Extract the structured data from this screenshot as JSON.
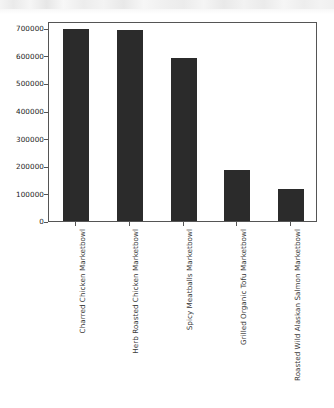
{
  "chart_data": {
    "type": "bar",
    "title": "",
    "subtitle": "",
    "xlabel": "",
    "ylabel": "",
    "categories": [
      "Charred Chicken Marketbowl",
      "Herb Roasted Chicken Marketbowl",
      "Spicy Meatballs Marketbowl",
      "Grilled Organic Tofu Marketbowl",
      "Roasted Wild Alaskan Salmon Marketbowl"
    ],
    "values": [
      697000,
      693000,
      590000,
      185000,
      117000
    ],
    "ylim": [
      0,
      725000
    ],
    "yticks": [
      0,
      100000,
      200000,
      300000,
      400000,
      500000,
      600000,
      700000
    ],
    "ytick_labels": [
      "0",
      "100000",
      "200000",
      "300000",
      "400000",
      "500000",
      "600000",
      "700000"
    ],
    "grid": false,
    "legend": false,
    "legend_position": "none",
    "bar_color": "#2b2b2b",
    "axis_color": "#555555",
    "background_color": "#ffffff",
    "tick_label_color": "#3a3a3a",
    "xtick_label_rotation": "-90"
  }
}
